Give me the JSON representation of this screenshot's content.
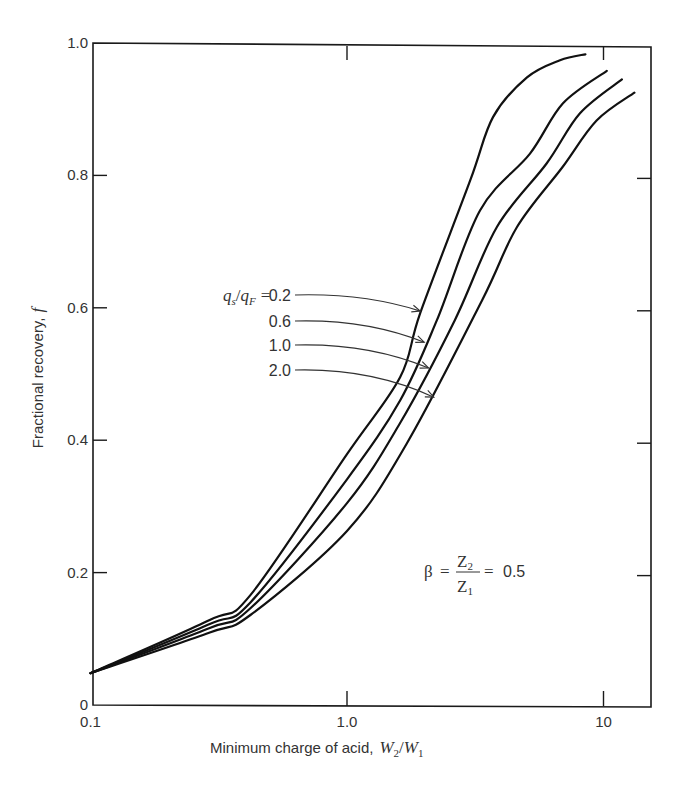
{
  "chart_data": {
    "type": "line",
    "title": "",
    "xlabel": "Minimum charge of acid,",
    "xlabel_math": {
      "main": "W",
      "sub1": "2",
      "sep": "/",
      "main2": "W",
      "sub2": "1"
    },
    "ylabel": "Fractional recovery,",
    "ylabel_math": "f",
    "xscale": "log",
    "xlim": [
      0.1,
      15
    ],
    "ylim": [
      0,
      1.0
    ],
    "grid": false,
    "x_ticks": [
      {
        "value": 0.1,
        "label": "0.1"
      },
      {
        "value": 1.0,
        "label": "1.0"
      },
      {
        "value": 10,
        "label": "10"
      }
    ],
    "y_ticks": [
      {
        "value": 0,
        "label": "0"
      },
      {
        "value": 0.2,
        "label": "0.2"
      },
      {
        "value": 0.4,
        "label": "0.4"
      },
      {
        "value": 0.6,
        "label": "0.6"
      },
      {
        "value": 0.8,
        "label": "0.8"
      },
      {
        "value": 1.0,
        "label": "1.0"
      }
    ],
    "legend": {
      "placement": "center (inline labels with arrows)",
      "prefix_math": {
        "q1": "q",
        "s1": "s",
        "sep": "/",
        "q2": "q",
        "s2": "F",
        "eq": "="
      }
    },
    "series": [
      {
        "name": "0.2",
        "label": "0.2",
        "x": [
          0.1,
          0.29,
          0.42,
          1.0,
          1.61,
          1.93,
          3.02,
          3.71,
          5.03,
          6.77,
          8.5
        ],
        "y": [
          0.048,
          0.128,
          0.166,
          0.379,
          0.495,
          0.592,
          0.792,
          0.888,
          0.948,
          0.974,
          0.983
        ],
        "arrow_target": {
          "x": 1.93,
          "y": 0.595
        }
      },
      {
        "name": "0.6",
        "label": "0.6",
        "x": [
          0.1,
          0.29,
          0.42,
          1.0,
          1.61,
          2.24,
          3.3,
          5.17,
          6.95,
          10.3
        ],
        "y": [
          0.048,
          0.122,
          0.155,
          0.341,
          0.46,
          0.581,
          0.747,
          0.833,
          0.909,
          0.958
        ],
        "arrow_target": {
          "x": 2.0,
          "y": 0.548
        }
      },
      {
        "name": "1.0",
        "label": "1.0",
        "x": [
          0.1,
          0.29,
          0.42,
          1.0,
          1.61,
          2.63,
          3.84,
          6.0,
          8.1,
          11.8
        ],
        "y": [
          0.048,
          0.116,
          0.146,
          0.305,
          0.426,
          0.581,
          0.722,
          0.818,
          0.894,
          0.945
        ],
        "arrow_target": {
          "x": 2.08,
          "y": 0.509
        }
      },
      {
        "name": "2.0",
        "label": "2.0",
        "x": [
          0.1,
          0.29,
          0.42,
          1.0,
          1.71,
          3.36,
          4.6,
          6.9,
          9.4,
          13.2
        ],
        "y": [
          0.048,
          0.109,
          0.136,
          0.263,
          0.395,
          0.611,
          0.722,
          0.812,
          0.883,
          0.925
        ],
        "arrow_target": {
          "x": 2.18,
          "y": 0.465
        }
      }
    ],
    "annotations": [
      {
        "text": "β = Z2/Z1 = 0.5",
        "beta": "β",
        "eq": "=",
        "num": "Z",
        "num_sub": "2",
        "den": "Z",
        "den_sub": "1",
        "eq2": "=",
        "value": "0.5",
        "x": 4.0,
        "y": 0.2
      }
    ]
  }
}
